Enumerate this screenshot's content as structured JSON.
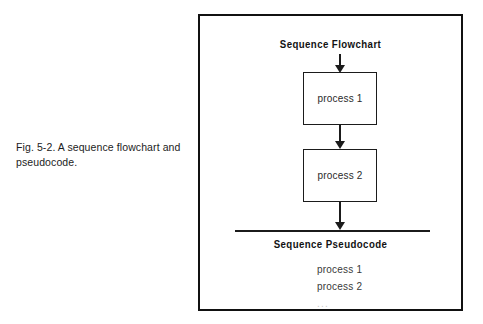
{
  "caption": {
    "lines": [
      "Fig. 5-2. A sequence flowchart and",
      "pseudocode."
    ]
  },
  "panel": {
    "flowchart": {
      "title": "Sequence Flowchart",
      "nodes": [
        {
          "label": "process 1"
        },
        {
          "label": "process 2"
        }
      ],
      "connectors": [
        {
          "name": "entry-arrow"
        },
        {
          "name": "between-processes-arrow"
        },
        {
          "name": "exit-arrow"
        }
      ]
    },
    "pseudocode": {
      "title": "Sequence Pseudocode",
      "statements": [
        "process 1",
        "process 2",
        "..."
      ]
    }
  },
  "colors": {
    "ink": "#1b1b1b",
    "frame": "#111111",
    "page": "#ffffff",
    "faint_text": "#c9c9c9"
  }
}
